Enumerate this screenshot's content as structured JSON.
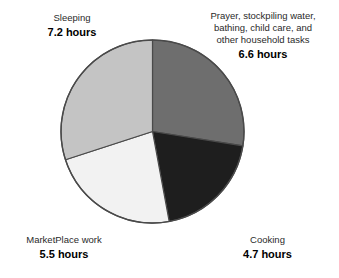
{
  "clipped_top": {
    "fragment_left": "",
    "fragment_right": ""
  },
  "chart_data": {
    "type": "pie",
    "title": "",
    "subtitle": "",
    "xlabel": "",
    "ylabel": "",
    "unit": "hours",
    "total": 24.0,
    "grid": false,
    "legend_position": "callout-labels",
    "start_angle_deg": 0,
    "direction": "clockwise",
    "categories": [
      "Prayer, stockpiling water, bathing, child care, and other household tasks",
      "Cooking",
      "MarketPlace work",
      "Sleeping"
    ],
    "values": [
      6.6,
      4.7,
      5.5,
      7.2
    ],
    "slices": [
      {
        "label": "Prayer, stockpiling water, bathing, child care, and other household tasks",
        "label_lines": [
          "Prayer, stockpiling water,",
          "bathing, child care, and",
          "other household tasks"
        ],
        "value": 6.6,
        "value_text": "6.6 hours",
        "percent": 27.5,
        "color": "#6e6e6e",
        "start_deg": 0,
        "end_deg": 99
      },
      {
        "label": "Cooking",
        "label_lines": [
          "Cooking"
        ],
        "value": 4.7,
        "value_text": "4.7 hours",
        "percent": 19.6,
        "color": "#1e1e1e",
        "start_deg": 99,
        "end_deg": 169.5
      },
      {
        "label": "MarketPlace work",
        "label_lines": [
          "MarketPlace work"
        ],
        "value": 5.5,
        "value_text": "5.5 hours",
        "percent": 22.9,
        "color": "#f2f2f2",
        "start_deg": 169.5,
        "end_deg": 252
      },
      {
        "label": "Sleeping",
        "label_lines": [
          "Sleeping"
        ],
        "value": 7.2,
        "value_text": "7.2 hours",
        "percent": 30.0,
        "color": "#c4c4c4",
        "start_deg": 252,
        "end_deg": 360
      }
    ],
    "stroke_color": "#4a4a4a",
    "background": "#ffffff"
  },
  "callouts": {
    "sleeping": {
      "name": "Sleeping",
      "value": "7.2 hours"
    },
    "household": {
      "line1": "Prayer, stockpiling water,",
      "line2": "bathing, child care, and",
      "line3": "other household tasks",
      "value": "6.6 hours"
    },
    "marketplace": {
      "name": "MarketPlace work",
      "value": "5.5 hours"
    },
    "cooking": {
      "name": "Cooking",
      "value": "4.7 hours"
    }
  }
}
